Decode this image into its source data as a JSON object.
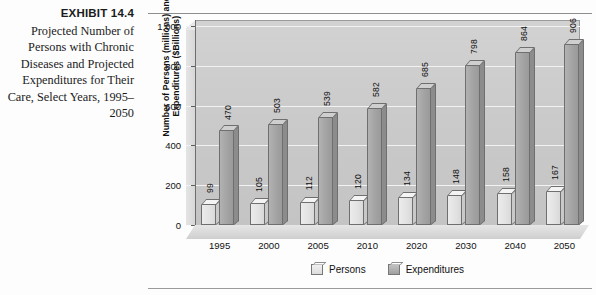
{
  "exhibit": {
    "number": "EXHIBIT 14.4",
    "caption": "Projected Number of Persons with Chronic Diseases and Projected Expenditures for Their Care, Select Years, 1995–2050"
  },
  "legend": {
    "persons_label": "Persons",
    "expenditures_label": "Expenditures"
  },
  "colors": {
    "persons": "#e2e2e2",
    "expenditures": "#a3a3a3",
    "plot_background": "#c9c9c9",
    "gridline": "#f2f2f2",
    "text": "#111111"
  },
  "chart_data": {
    "type": "bar",
    "title": "",
    "subtitle": "",
    "xlabel": "",
    "ylabel": "Number of Persons (millions) and Expenditures ($Billions)",
    "categories": [
      "1995",
      "2000",
      "2005",
      "2010",
      "2020",
      "2030",
      "2040",
      "2050"
    ],
    "series": [
      {
        "name": "Persons",
        "values": [
          99,
          105,
          112,
          120,
          134,
          148,
          158,
          167
        ]
      },
      {
        "name": "Expenditures",
        "values": [
          470,
          503,
          539,
          582,
          685,
          798,
          864,
          906
        ]
      }
    ],
    "ylim": [
      0,
      1000
    ],
    "yticks": [
      0,
      200,
      400,
      600,
      800,
      1000
    ],
    "ytick_labels": [
      "0",
      "200",
      "400",
      "600",
      "800",
      "1,000"
    ],
    "grid": true,
    "legend_position": "bottom",
    "style": "3d-clustered-bar"
  }
}
